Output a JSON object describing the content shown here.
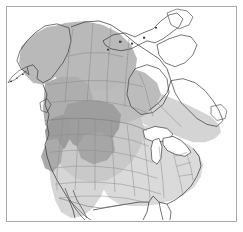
{
  "figure": {
    "width": 243,
    "height": 232,
    "background_color": "#ffffff"
  },
  "frame": {
    "border_color": "#a9a9a9",
    "border_width": 1,
    "inset": 6,
    "fill_color": "#ffffff"
  },
  "map": {
    "projection_note": "polar-style conic, North America",
    "outline_color": "#3c3c3c",
    "internal_border_color": "#8e8e8e",
    "water_color": "#ffffff",
    "unshaded_land_color": "#ffffff",
    "regions": [
      {
        "name": "alaska",
        "label": "Alaska",
        "shade": "medium",
        "color": "#b9b9b9"
      },
      {
        "name": "yukon-nwt",
        "label": "Yukon and Northwest Territories",
        "shade": "medium",
        "color": "#b9b9b9"
      },
      {
        "name": "british-columbia",
        "label": "British Columbia",
        "shade": "medium-dark",
        "color": "#aeaeae"
      },
      {
        "name": "prairie-provinces",
        "label": "Prairie Provinces",
        "shade": "medium",
        "color": "#bcbcbc"
      },
      {
        "name": "northern-rockies",
        "label": "Northern Rocky Mountains",
        "shade": "dark",
        "color": "#9e9e9e"
      },
      {
        "name": "great-plains",
        "label": "Great Plains",
        "shade": "light-medium",
        "color": "#c9c9c9"
      },
      {
        "name": "eastern-canada",
        "label": "Eastern Canada",
        "shade": "light",
        "color": "#d4d4d4"
      },
      {
        "name": "eastern-united-states",
        "label": "Eastern United States",
        "shade": "light",
        "color": "#dadada"
      },
      {
        "name": "southwest-united-states",
        "label": "Southwestern United States",
        "shade": "light",
        "color": "#d6d6d6"
      },
      {
        "name": "canadian-arctic",
        "label": "Canadian Arctic Archipelago",
        "shade": "none",
        "color": "#ffffff"
      },
      {
        "name": "hudson-bay",
        "label": "Hudson Bay",
        "shade": "water",
        "color": "#ffffff"
      },
      {
        "name": "great-lakes",
        "label": "Great Lakes",
        "shade": "water",
        "color": "#ffffff"
      },
      {
        "name": "labrador-maritimes",
        "label": "Labrador and Maritimes",
        "shade": "none",
        "color": "#ffffff"
      },
      {
        "name": "northern-mexico",
        "label": "Northern Mexico",
        "shade": "none",
        "color": "#ffffff"
      }
    ],
    "shade_levels": [
      {
        "key": "dark",
        "color": "#9e9e9e",
        "meaning": "core range"
      },
      {
        "key": "medium",
        "color": "#b9b9b9",
        "meaning": "main range"
      },
      {
        "key": "light",
        "color": "#d8d8d8",
        "meaning": "peripheral range"
      },
      {
        "key": "none",
        "color": "#ffffff",
        "meaning": "outside range"
      }
    ]
  },
  "labels": {
    "visible_text": []
  }
}
